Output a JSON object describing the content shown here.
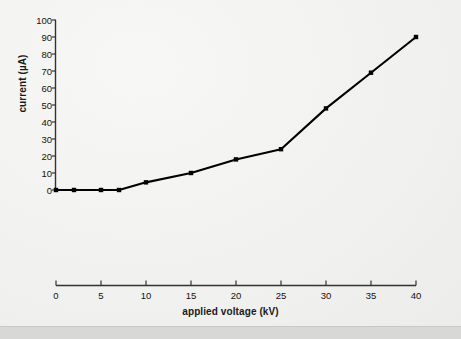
{
  "chart_data": {
    "type": "line",
    "title": "",
    "xlabel": "applied voltage (kV)",
    "ylabel": "current (µA)",
    "xlim": [
      0,
      40
    ],
    "ylim": [
      0,
      100
    ],
    "xticks": [
      "0",
      "5",
      "10",
      "15",
      "20",
      "25",
      "30",
      "35",
      "40"
    ],
    "yticks": [
      "0",
      "10",
      "20",
      "30",
      "40",
      "50",
      "60",
      "70",
      "80",
      "90",
      "100"
    ],
    "grid": false,
    "legend": null,
    "series": [
      {
        "name": "current",
        "marker": "dot",
        "color": "#000000",
        "x": [
          0,
          2,
          5,
          7,
          10,
          15,
          20,
          25,
          30,
          35,
          40
        ],
        "values": [
          0,
          0,
          0,
          0,
          4.5,
          10,
          18,
          24,
          48,
          69,
          90
        ]
      }
    ]
  },
  "axes": {
    "y_axis_label": "current (µA)",
    "x_axis_label": "applied voltage (kV)"
  },
  "colors": {
    "line": "#000000",
    "axis": "#333333",
    "background": "#f1f1ef",
    "footer_band": "#d8d8d6"
  }
}
